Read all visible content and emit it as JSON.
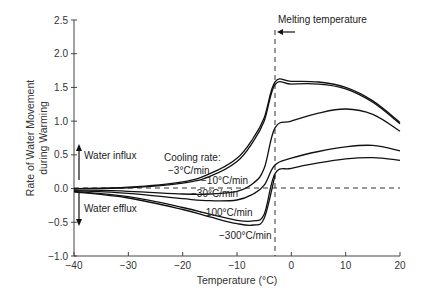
{
  "chart_data": {
    "type": "line",
    "title": "",
    "xlabel": "Temperature (°C)",
    "ylabel": "Rate of Water Movement during Warming",
    "ylabel_lines": [
      "Rate of Water Movement",
      "during Warming"
    ],
    "xlim": [
      -40,
      20
    ],
    "ylim": [
      -1.0,
      2.5
    ],
    "xticks": [
      -40,
      -30,
      -20,
      -10,
      0,
      10,
      20
    ],
    "xtick_labels": [
      "−40",
      "−30",
      "−20",
      "−10",
      "0",
      "10",
      "20"
    ],
    "yticks": [
      -1.0,
      -0.5,
      0.0,
      0.5,
      1.0,
      1.5,
      2.0,
      2.5
    ],
    "ytick_labels": [
      "−1.0",
      "−0.5",
      "0.0",
      "0.5",
      "1.0",
      "1.5",
      "2.0",
      "2.5"
    ],
    "grid": false,
    "reference_lines": {
      "horizontal_dashed_y": 0.0,
      "vertical_dashed_x": -3
    },
    "annotations": {
      "melting": "Melting temperature",
      "influx": "Water influx",
      "efflux": "Water efflux",
      "cooling_rate_header": "Cooling rate:"
    },
    "series": [
      {
        "name": "−3°C/min",
        "x": [
          -40,
          -30,
          -20,
          -15,
          -10,
          -7,
          -5,
          -3,
          0,
          5,
          10,
          15,
          20
        ],
        "y": [
          0.0,
          0.02,
          0.1,
          0.22,
          0.45,
          0.75,
          1.05,
          1.58,
          1.59,
          1.58,
          1.5,
          1.3,
          0.98
        ]
      },
      {
        "name": "−3°C/min (b)",
        "x": [
          -40,
          -30,
          -20,
          -15,
          -10,
          -7,
          -5,
          -3,
          0,
          5,
          10,
          15,
          20
        ],
        "y": [
          0.0,
          0.01,
          0.08,
          0.18,
          0.4,
          0.7,
          1.0,
          1.54,
          1.55,
          1.55,
          1.48,
          1.28,
          0.96
        ]
      },
      {
        "name": "−10°C/min",
        "x": [
          -40,
          -30,
          -20,
          -15,
          -10,
          -7,
          -5,
          -3,
          0,
          5,
          10,
          15,
          20
        ],
        "y": [
          -0.02,
          -0.04,
          -0.08,
          -0.08,
          -0.04,
          0.08,
          0.3,
          0.9,
          1.0,
          1.12,
          1.18,
          1.1,
          0.85
        ]
      },
      {
        "name": "−30°C/min",
        "x": [
          -40,
          -30,
          -20,
          -15,
          -10,
          -7,
          -5,
          -3,
          0,
          5,
          10,
          15,
          20
        ],
        "y": [
          -0.03,
          -0.07,
          -0.15,
          -0.18,
          -0.17,
          -0.08,
          0.05,
          0.35,
          0.45,
          0.55,
          0.62,
          0.64,
          0.56
        ]
      },
      {
        "name": "−100°C/min",
        "x": [
          -40,
          -30,
          -20,
          -15,
          -10,
          -7,
          -5,
          -3,
          0,
          5,
          10,
          15,
          20
        ],
        "y": [
          -0.04,
          -0.12,
          -0.28,
          -0.38,
          -0.47,
          -0.48,
          -0.38,
          0.22,
          0.3,
          0.38,
          0.44,
          0.46,
          0.42
        ]
      },
      {
        "name": "−300°C/min",
        "x": [
          -40,
          -30,
          -20,
          -15,
          -10,
          -7,
          -5,
          -3
        ],
        "y": [
          -0.05,
          -0.14,
          -0.31,
          -0.42,
          -0.52,
          -0.54,
          -0.44,
          0.2
        ]
      }
    ],
    "curve_labels": [
      "−3°C/min",
      "−10°C/min",
      "−30°C/min",
      "−100°C/min",
      "−300°C/min"
    ]
  }
}
